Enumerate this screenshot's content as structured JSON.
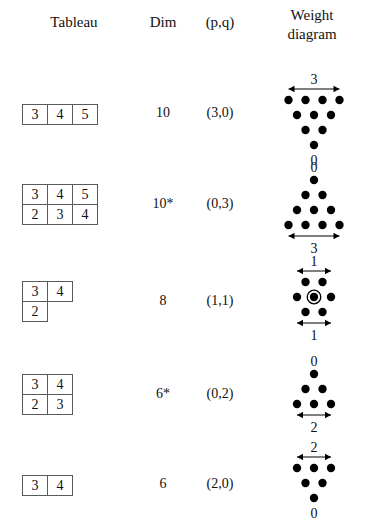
{
  "header": {
    "col_tableau": "Tableau",
    "col_dim": "Dim",
    "col_pq": "(p,q)",
    "col_weight_line1": "Weight",
    "col_weight_line2": "diagram"
  },
  "colors": {
    "ink": "#111111",
    "box_border": "#5a5a5a",
    "dot": "#000000",
    "arrow": "#000000",
    "background": "#ffffff"
  },
  "rows": [
    {
      "tableau": [
        [
          "3",
          "4",
          "5"
        ]
      ],
      "dim": "10",
      "pq": "(3,0)",
      "weight": {
        "shape": "inverted-triangle",
        "rows": [
          4,
          3,
          2,
          1
        ],
        "top_label": "3",
        "top_arrow": true,
        "bottom_label": "0",
        "bottom_arrow": false,
        "center_double": false
      }
    },
    {
      "tableau": [
        [
          "3",
          "4",
          "5"
        ],
        [
          "2",
          "3",
          "4"
        ]
      ],
      "dim": "10*",
      "pq": "(0,3)",
      "weight": {
        "shape": "triangle",
        "rows": [
          1,
          2,
          3,
          4
        ],
        "top_label": "0",
        "top_arrow": false,
        "bottom_label": "3",
        "bottom_arrow": true,
        "center_double": false
      }
    },
    {
      "tableau": [
        [
          "3",
          "4"
        ],
        [
          "2"
        ]
      ],
      "dim": "8",
      "pq": "(1,1)",
      "weight": {
        "shape": "hexagon",
        "rows": [
          2,
          3,
          2
        ],
        "top_label": "1",
        "top_arrow": true,
        "bottom_label": "1",
        "bottom_arrow": true,
        "center_double": true
      }
    },
    {
      "tableau": [
        [
          "3",
          "4"
        ],
        [
          "2",
          "3"
        ]
      ],
      "dim": "6*",
      "pq": "(0,2)",
      "weight": {
        "shape": "triangle",
        "rows": [
          1,
          2,
          3
        ],
        "top_label": "0",
        "top_arrow": false,
        "bottom_label": "2",
        "bottom_arrow": true,
        "center_double": false
      }
    },
    {
      "tableau": [
        [
          "3",
          "4"
        ]
      ],
      "dim": "6",
      "pq": "(2,0)",
      "weight": {
        "shape": "inverted-triangle",
        "rows": [
          3,
          2,
          1
        ],
        "top_label": "2",
        "top_arrow": true,
        "bottom_label": "0",
        "bottom_arrow": false,
        "center_double": false
      }
    }
  ]
}
